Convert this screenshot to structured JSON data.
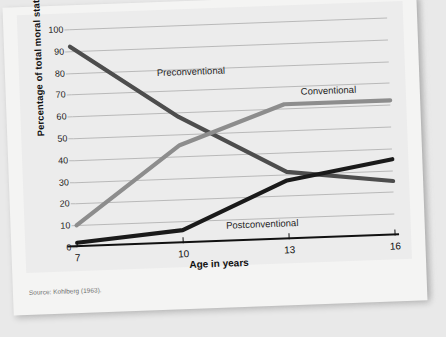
{
  "source_note": "Source: Kohlberg (1963).",
  "colors": {
    "preconventional": "#4d4d4d",
    "conventional": "#8d8d8d",
    "postconventional": "#1a1a1a",
    "grid": "#b9b9b9",
    "axis": "#111111",
    "plate_bg": "#ececec",
    "page_bg": "#f4f4f3"
  },
  "chart_data": {
    "type": "line",
    "title": "",
    "xlabel": "Age in years",
    "ylabel": "Percentage of total moral statements",
    "x": [
      7,
      10,
      13,
      16
    ],
    "xticks": [
      "7",
      "10",
      "13",
      "16"
    ],
    "yticks": [
      "0",
      "10",
      "20",
      "30",
      "40",
      "50",
      "60",
      "70",
      "80",
      "90",
      "100"
    ],
    "ylim": [
      0,
      100
    ],
    "xlim": [
      7,
      16
    ],
    "grid": true,
    "legend": "inline-labels",
    "series": [
      {
        "name": "Preconventional",
        "values": [
          92,
          58,
          31,
          25
        ]
      },
      {
        "name": "Conventional",
        "values": [
          10,
          45,
          62,
          62
        ]
      },
      {
        "name": "Postconventional",
        "values": [
          2,
          6,
          27,
          35
        ]
      }
    ],
    "annotations": [
      {
        "text": "Preconventional",
        "x_pct": 27,
        "y_pct": 19
      },
      {
        "text": "Conventional",
        "x_pct": 72,
        "y_pct": 30
      },
      {
        "text": "Postconventional",
        "x_pct": 47,
        "y_pct": 90
      }
    ]
  }
}
